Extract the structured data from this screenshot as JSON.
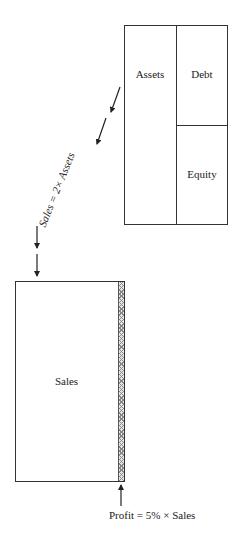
{
  "balance_sheet": {
    "assets_label": "Assets",
    "debt_label": "Debt",
    "equity_label": "Equity"
  },
  "relationship": {
    "turnover_label": "Sales = 2× Assets"
  },
  "income": {
    "sales_label": "Sales",
    "profit_label": "Profit = 5% × Sales"
  },
  "colors": {
    "line": "#333333",
    "background": "#ffffff",
    "hatch": "#999999"
  }
}
